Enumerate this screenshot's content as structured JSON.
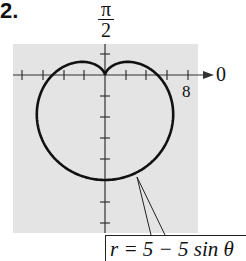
{
  "problem_number": "2.",
  "chart_data": {
    "type": "polar-line",
    "title": "",
    "equation": "r = 5 − 5 sin θ",
    "angle_labels": {
      "top": "π/2",
      "right": "0"
    },
    "radial_tick_label": "8",
    "radial_tick_spacing": 2,
    "xlim": [
      -8,
      8
    ],
    "ylim": [
      -12,
      3
    ],
    "grid": false,
    "background": "#e4e4e4",
    "curve_color": "#111111",
    "series": [
      {
        "name": "r = 5 − 5 sin θ",
        "shape": "cardioid",
        "cusp": [
          0,
          0
        ],
        "extreme_points": {
          "bottom": [
            0,
            -10
          ],
          "left": [
            -5,
            0
          ],
          "right": [
            5,
            0
          ],
          "top_lobes": [
            [
              -2.5,
              1.25
            ],
            [
              2.5,
              1.25
            ]
          ]
        }
      }
    ]
  },
  "labels": {
    "pi_num": "π",
    "pi_den": "2",
    "zero": "0",
    "eight": "8",
    "equation": "r = 5 − 5 sin θ"
  }
}
